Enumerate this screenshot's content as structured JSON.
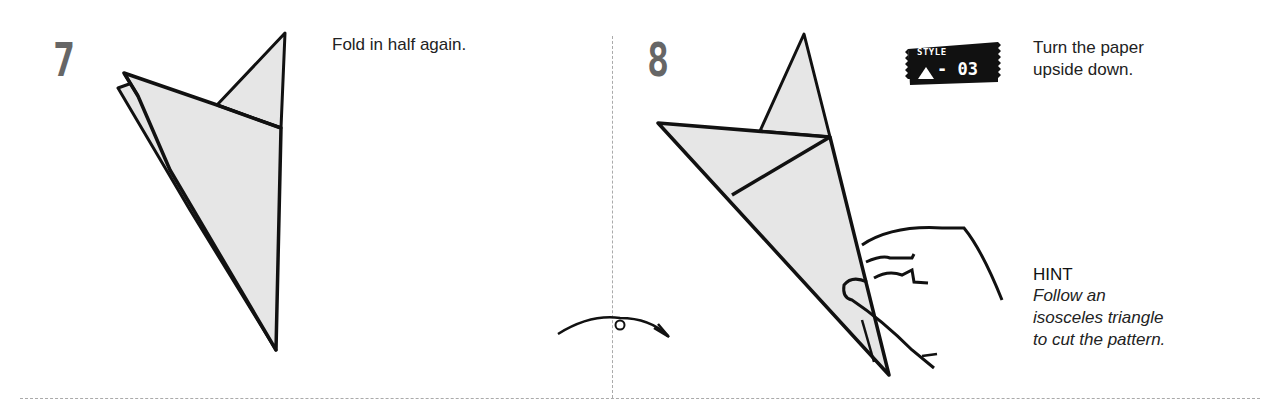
{
  "steps": [
    {
      "number": "7",
      "caption": "Fold in half again."
    },
    {
      "number": "8",
      "caption_line1": "Turn the paper",
      "caption_line2": "upside down.",
      "style_badge": {
        "label": "STYLE",
        "code": "- 03",
        "icon": "triangle-icon"
      }
    }
  ],
  "hint": {
    "title": "HINT",
    "lines": [
      "Follow an",
      "isosceles triangle",
      "to cut the pattern."
    ]
  },
  "colors": {
    "paper_fill": "#e6e6e6",
    "line": "#111111",
    "step_number": "#666666",
    "divider": "#aaaaaa"
  }
}
